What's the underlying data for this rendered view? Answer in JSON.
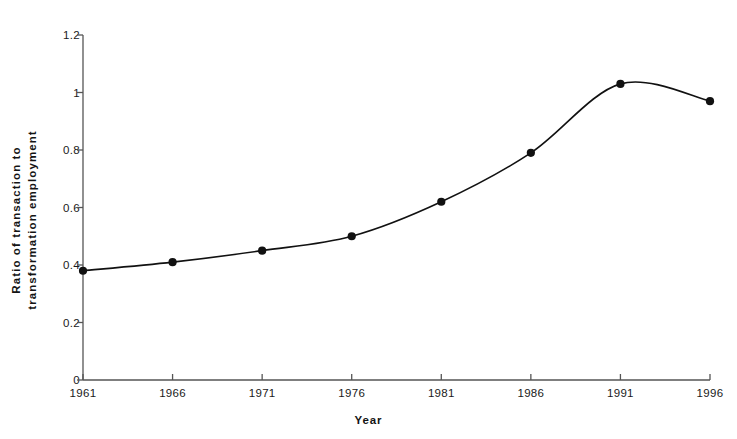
{
  "chart_data": {
    "type": "line",
    "title": "",
    "xlabel": "Year",
    "ylabel": "Ratio of transaction to transformation employment",
    "ylabel_lines": [
      "Ratio of  transaction  to",
      "transformation  employment"
    ],
    "categories": [
      1961,
      1966,
      1971,
      1976,
      1981,
      1986,
      1991,
      1996
    ],
    "x": [
      1961,
      1966,
      1971,
      1976,
      1981,
      1986,
      1991,
      1996
    ],
    "values": [
      0.38,
      0.41,
      0.45,
      0.5,
      0.62,
      0.79,
      1.03,
      0.97
    ],
    "xlim": [
      1961,
      1996
    ],
    "ylim": [
      0,
      1.2
    ],
    "yticks": [
      0,
      0.2,
      0.4,
      0.6,
      0.8,
      1,
      1.2
    ],
    "ytick_labels": [
      "0",
      "0.2",
      "0.4",
      "0.6",
      "0.8",
      "1",
      "1.2"
    ],
    "xticks": [
      1961,
      1966,
      1971,
      1976,
      1981,
      1986,
      1991,
      1996
    ],
    "xtick_labels": [
      "1961",
      "1966",
      "1971",
      "1976",
      "1981",
      "1986",
      "1991",
      "1996"
    ],
    "grid": false,
    "legend": null,
    "legend_position": "none",
    "series": [
      {
        "name": "Ratio of transaction to transformation employment",
        "values": [
          0.38,
          0.41,
          0.45,
          0.5,
          0.62,
          0.79,
          1.03,
          0.97
        ],
        "line_color": "#111111",
        "marker": "circle",
        "marker_color": "#111111",
        "smoothing": "spline"
      }
    ],
    "colors": {
      "line": "#111111",
      "marker": "#111111",
      "axis": "#555555",
      "text": "#1a1a1a",
      "background": "#ffffff"
    }
  }
}
